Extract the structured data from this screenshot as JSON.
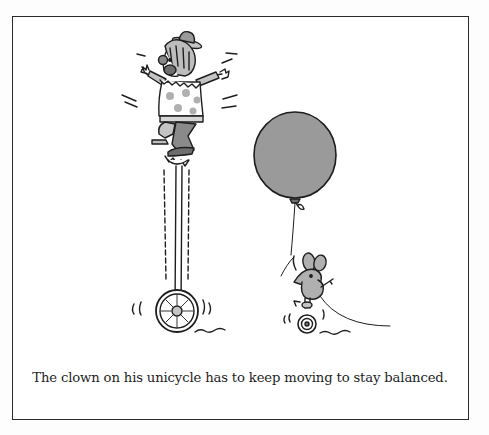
{
  "figure": {
    "caption": "The clown on his unicycle has to keep moving to stay balanced.",
    "elements": [
      {
        "name": "clown",
        "description": "Clown with bowler hat, round nose, polka-dot ruffled shirt, balancing on tall unicycle"
      },
      {
        "name": "tall-unicycle",
        "description": "Giraffe unicycle with long frame and spoked wheel"
      },
      {
        "name": "balloon",
        "description": "Large grey balloon tied with string"
      },
      {
        "name": "mouse",
        "description": "Small mouse riding tiny unicycle, holding balloon string"
      }
    ],
    "colors": {
      "ink": "#1e1e1e",
      "fill_grey": "#9a9a9a",
      "light_grey": "#c4c4c4",
      "paper": "#ffffff"
    }
  }
}
